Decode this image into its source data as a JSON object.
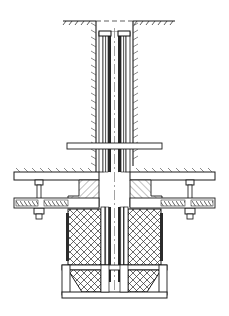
{
  "figure": {
    "type": "engineering-cross-section",
    "title": "",
    "caption": "",
    "background": "#ffffff",
    "line_color": "#1a1a1a",
    "hatch_color": "#333333"
  },
  "callouts": [
    {
      "id": "11",
      "label": "11",
      "x": 155,
      "y": 16,
      "leader": [
        [
          152,
          18
        ],
        [
          140,
          23
        ]
      ]
    },
    {
      "id": "10",
      "label": "10",
      "x": 152,
      "y": 57,
      "leader": [
        [
          150,
          55
        ],
        [
          136,
          59
        ]
      ]
    },
    {
      "id": "9",
      "label": "9",
      "x": 152,
      "y": 78,
      "leader": [
        [
          150,
          76
        ],
        [
          136,
          80
        ]
      ]
    },
    {
      "id": "8",
      "label": "8",
      "x": 152,
      "y": 96,
      "leader": [
        [
          150,
          94
        ],
        [
          136,
          98
        ]
      ]
    },
    {
      "id": "7",
      "label": "7",
      "x": 152,
      "y": 113,
      "leader": [
        [
          150,
          111
        ],
        [
          136,
          115
        ]
      ]
    },
    {
      "id": "1",
      "label": "1",
      "x": 71,
      "y": 156,
      "leader": [
        [
          74,
          158
        ],
        [
          92,
          172
        ]
      ]
    },
    {
      "id": "6",
      "label": "6",
      "x": 180,
      "y": 166,
      "leader": [
        [
          178,
          168
        ],
        [
          160,
          176
        ]
      ]
    },
    {
      "id": "2",
      "label": "2",
      "x": 44,
      "y": 230,
      "leader": [
        [
          48,
          228
        ],
        [
          70,
          213
        ]
      ]
    },
    {
      "id": "3",
      "label": "3",
      "x": 44,
      "y": 253,
      "leader": [
        [
          48,
          251
        ],
        [
          74,
          230
        ]
      ]
    },
    {
      "id": "5",
      "label": "5",
      "x": 188,
      "y": 242,
      "leader": [
        [
          186,
          240
        ],
        [
          172,
          222
        ]
      ]
    },
    {
      "id": "4",
      "label": "4",
      "x": 44,
      "y": 290,
      "leader": [
        [
          48,
          288
        ],
        [
          78,
          276
        ]
      ]
    }
  ],
  "parts": {
    "ground_line": "soil surface with hatch",
    "outer_bore": "borehole wall, earth hatch",
    "inner_tube": "layered concentric tube walls",
    "top_caps": "two light cap blocks at tube top",
    "cross_bar": "horizontal tie bar across tube",
    "flange_plate": "upper flange plate",
    "flange_block": "diagonally hatched flange body",
    "bolt_left": "bolt and nut assembly, left",
    "bolt_right": "bolt and nut assembly, right",
    "spring_left": "coil/spring washer stack, left",
    "spring_right": "coil/spring washer stack, right",
    "sleeve_body": "cross-hatched sleeve segments",
    "cone_base": "conical funnel base, cross-hatched",
    "base_plate": "bottom base plate"
  }
}
